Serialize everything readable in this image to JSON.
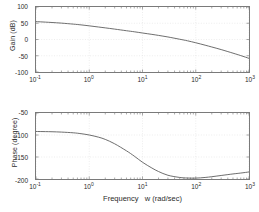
{
  "figure": {
    "title": "",
    "background_color": "#ffffff",
    "axis_color": "#7a7a7a",
    "curve_color": "#5a5a5a",
    "grid_color": "#d9d9d9"
  },
  "xlabel": "Frequency   w (rad/sec)",
  "gain": {
    "ylabel": "Gain (dB)",
    "yticks": [
      "100",
      "50",
      "0",
      "-50",
      "-100"
    ]
  },
  "phase": {
    "ylabel": "Phase (degree)",
    "yticks": [
      "-50",
      "-100",
      "-150",
      "-200"
    ]
  },
  "xticks": [
    {
      "mantissa": "10",
      "exponent": "-1"
    },
    {
      "mantissa": "10",
      "exponent": "0"
    },
    {
      "mantissa": "10",
      "exponent": "1"
    },
    {
      "mantissa": "10",
      "exponent": "2"
    },
    {
      "mantissa": "10",
      "exponent": "3"
    }
  ],
  "chart_data": [
    {
      "type": "line",
      "title": "Bode Magnitude Plot",
      "xlabel": "Frequency   w (rad/sec)",
      "ylabel": "Gain (dB)",
      "xscale": "log",
      "xlim": [
        0.1,
        1000
      ],
      "ylim": [
        -100,
        100
      ],
      "yticks": [
        -100,
        -50,
        0,
        50,
        100
      ],
      "xticks": [
        0.1,
        1,
        10,
        100,
        1000
      ],
      "grid": true,
      "legend": "none",
      "series": [
        {
          "name": "Gain",
          "x": [
            0.1,
            0.15,
            0.2,
            0.3,
            0.5,
            0.7,
            1,
            1.5,
            2,
            3,
            5,
            7,
            10,
            15,
            20,
            30,
            50,
            70,
            100,
            150,
            200,
            300,
            500,
            700,
            1000
          ],
          "y": [
            55,
            53.5,
            52.3,
            50.4,
            47.3,
            45.0,
            42.0,
            38.4,
            35.8,
            32.0,
            27.0,
            23.8,
            20.0,
            15.8,
            12.6,
            7.8,
            0.8,
            -4.0,
            -10.0,
            -17.5,
            -23.0,
            -31.0,
            -42.0,
            -49.5,
            -58.0
          ]
        }
      ]
    },
    {
      "type": "line",
      "title": "Bode Phase Plot",
      "xlabel": "Frequency   w (rad/sec)",
      "ylabel": "Phase (degree)",
      "xscale": "log",
      "xlim": [
        0.1,
        1000
      ],
      "ylim": [
        -200,
        -50
      ],
      "yticks": [
        -200,
        -150,
        -100,
        -50
      ],
      "xticks": [
        0.1,
        1,
        10,
        100,
        1000
      ],
      "grid": true,
      "legend": "none",
      "series": [
        {
          "name": "Phase",
          "x": [
            0.1,
            0.15,
            0.2,
            0.3,
            0.5,
            0.7,
            1,
            1.5,
            2,
            3,
            5,
            7,
            10,
            15,
            20,
            30,
            50,
            70,
            100,
            150,
            200,
            300,
            500,
            700,
            1000
          ],
          "y": [
            -92.0,
            -92.3,
            -92.6,
            -93.4,
            -95.0,
            -97.0,
            -100.0,
            -105.0,
            -110.0,
            -120.0,
            -136.0,
            -148.0,
            -162.0,
            -175.0,
            -183.0,
            -191.5,
            -196.5,
            -197.8,
            -198.0,
            -196.5,
            -194.8,
            -192.0,
            -188.5,
            -186.5,
            -184.0
          ]
        }
      ]
    }
  ]
}
